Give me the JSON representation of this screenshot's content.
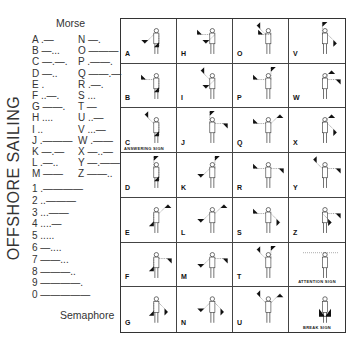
{
  "title": "OFFSHORE SAILING",
  "morse": {
    "heading": "Morse",
    "letters_left": [
      "A .—",
      "B —...",
      "C —.—.",
      "D —..",
      "E .",
      "F ..—.",
      "G ——.",
      "H ....",
      "I ..",
      "J .———",
      "K —.—",
      "L .—..",
      "M ——"
    ],
    "letters_right": [
      "N —.",
      "O ———",
      "P .——.",
      "Q ——.—",
      "R .—.",
      "S ...",
      "T —",
      "U ..—",
      "V ...—",
      "W .——",
      "X —..—",
      "Y —.——",
      "Z ——.."
    ],
    "digits": [
      "1 .————",
      "2 ..———",
      "3 ...——",
      "4 ....—",
      "5 .....",
      "6 —....",
      "7 ——...",
      "8 ———..",
      "9 ————.",
      "0 —————"
    ]
  },
  "semaphore": {
    "heading": "Semaphore",
    "rows": [
      [
        {
          "letter": "A"
        },
        {
          "letter": "H"
        },
        {
          "letter": "O"
        },
        {
          "letter": "V"
        }
      ],
      [
        {
          "letter": "B"
        },
        {
          "letter": "I"
        },
        {
          "letter": "P"
        },
        {
          "letter": "W"
        }
      ],
      [
        {
          "letter": "C",
          "caption": "ANSWERING SIGN"
        },
        {
          "letter": "J"
        },
        {
          "letter": "Q"
        },
        {
          "letter": "X"
        }
      ],
      [
        {
          "letter": "D"
        },
        {
          "letter": "K"
        },
        {
          "letter": "R"
        },
        {
          "letter": "Y"
        }
      ],
      [
        {
          "letter": "E"
        },
        {
          "letter": "L"
        },
        {
          "letter": "S"
        },
        {
          "letter": "Z"
        }
      ],
      [
        {
          "letter": "F"
        },
        {
          "letter": "M"
        },
        {
          "letter": "T"
        },
        {
          "letter": "",
          "caption": "ATTENTION SIGN"
        }
      ],
      [
        {
          "letter": "G"
        },
        {
          "letter": "N"
        },
        {
          "letter": "U"
        },
        {
          "letter": "",
          "caption": "BREAK SIGN"
        }
      ]
    ]
  }
}
